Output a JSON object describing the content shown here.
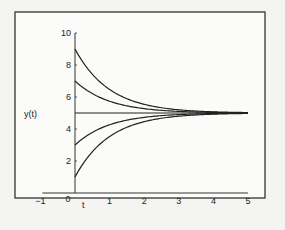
{
  "chart_data": {
    "type": "line",
    "title": "",
    "xlabel": "t",
    "ylabel": "y(t)",
    "xlim": [
      -1,
      5
    ],
    "ylim": [
      0,
      10
    ],
    "x_ticks": [
      "-1",
      "0",
      "1",
      "2",
      "3",
      "4",
      "5"
    ],
    "y_ticks": [
      "0",
      "2",
      "4",
      "6",
      "8",
      "10"
    ],
    "grid": false,
    "legend": "none",
    "equilibrium": 5,
    "series": [
      {
        "name": "y0=9",
        "y0": 9
      },
      {
        "name": "y0=7",
        "y0": 7
      },
      {
        "name": "y0=5",
        "y0": 5
      },
      {
        "name": "y0=3",
        "y0": 3
      },
      {
        "name": "y0=1",
        "y0": 1
      }
    ],
    "x": [
      0,
      0.5,
      1,
      1.5,
      2,
      2.5,
      3,
      3.5,
      4,
      4.5,
      5
    ]
  },
  "labels": {
    "xlabel": "t",
    "ylabel": "y(t)",
    "origin": "0"
  }
}
